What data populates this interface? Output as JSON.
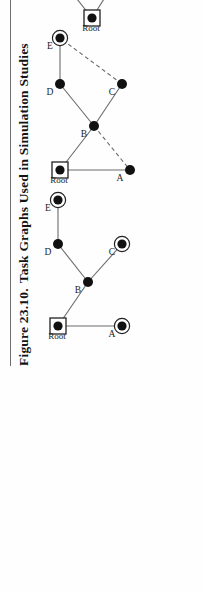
{
  "figure": {
    "caption_number": "Figure 23.10.",
    "caption_text": "Task Graphs Used in Simulation Studies"
  },
  "legend": {
    "items": [
      {
        "label": "Specialized Node",
        "symbol": "filled-dot"
      },
      {
        "label": "BFS tree edge",
        "symbol": "solid-line"
      },
      {
        "label": "nonBFS edge",
        "symbol": "dashed-line"
      },
      {
        "label": "Data Source",
        "symbol": "square-with-dot"
      },
      {
        "label": "Data Sink",
        "symbol": "double-circle"
      }
    ]
  },
  "colors": {
    "node_fill": "#111111",
    "edge": "#6a6a6a",
    "box_border": "#7c7c7c",
    "text": "#1d1d1d",
    "page_background": "#fefefe"
  },
  "graphs": [
    {
      "name": "graph-a",
      "nodes": [
        {
          "id": "Root",
          "label": "Root",
          "type": "source",
          "x": 22,
          "y": 28
        },
        {
          "id": "A",
          "label": "A",
          "type": "sink",
          "x": 22,
          "y": 92
        },
        {
          "id": "B",
          "label": "B",
          "type": "plain",
          "x": 66,
          "y": 58
        },
        {
          "id": "C",
          "label": "C",
          "type": "sink",
          "x": 104,
          "y": 92
        },
        {
          "id": "D",
          "label": "D",
          "type": "plain",
          "x": 104,
          "y": 28
        },
        {
          "id": "E",
          "label": "E",
          "type": "sink",
          "x": 148,
          "y": 28
        }
      ],
      "edges": [
        {
          "from": "Root",
          "to": "A",
          "style": "bfs"
        },
        {
          "from": "Root",
          "to": "B",
          "style": "bfs"
        },
        {
          "from": "B",
          "to": "C",
          "style": "bfs"
        },
        {
          "from": "B",
          "to": "D",
          "style": "bfs"
        },
        {
          "from": "D",
          "to": "E",
          "style": "bfs"
        }
      ]
    },
    {
      "name": "graph-b",
      "nodes": [
        {
          "id": "Root",
          "label": "Root",
          "type": "source",
          "x": 18,
          "y": 30
        },
        {
          "id": "A",
          "label": "A",
          "type": "plain",
          "x": 18,
          "y": 100
        },
        {
          "id": "B",
          "label": "B",
          "type": "plain",
          "x": 62,
          "y": 64
        },
        {
          "id": "C",
          "label": "C",
          "type": "plain",
          "x": 104,
          "y": 92
        },
        {
          "id": "D",
          "label": "D",
          "type": "plain",
          "x": 104,
          "y": 30
        },
        {
          "id": "E",
          "label": "E",
          "type": "sink",
          "x": 150,
          "y": 30
        }
      ],
      "edges": [
        {
          "from": "Root",
          "to": "A",
          "style": "bfs"
        },
        {
          "from": "Root",
          "to": "B",
          "style": "bfs"
        },
        {
          "from": "B",
          "to": "A",
          "style": "nonbfs"
        },
        {
          "from": "B",
          "to": "C",
          "style": "bfs"
        },
        {
          "from": "B",
          "to": "D",
          "style": "bfs"
        },
        {
          "from": "D",
          "to": "E",
          "style": "bfs"
        },
        {
          "from": "C",
          "to": "E",
          "style": "nonbfs"
        }
      ]
    },
    {
      "name": "graph-c",
      "nodes": [
        {
          "id": "Root",
          "label": "Root",
          "type": "source",
          "x": 14,
          "y": 62
        },
        {
          "id": "A",
          "label": "A",
          "type": "plain",
          "x": 52,
          "y": 86
        },
        {
          "id": "B",
          "label": "B",
          "type": "plain",
          "x": 52,
          "y": 32
        },
        {
          "id": "C",
          "label": "C",
          "type": "plain",
          "x": 104,
          "y": 108
        },
        {
          "id": "D",
          "label": "D",
          "type": "sink",
          "x": 104,
          "y": 64
        },
        {
          "id": "E",
          "label": "E",
          "type": "plain",
          "x": 104,
          "y": 10
        },
        {
          "id": "F",
          "label": "F",
          "type": "plain",
          "x": 150,
          "y": 132
        },
        {
          "id": "G",
          "label": "G",
          "type": "sink",
          "x": 150,
          "y": 84
        },
        {
          "id": "H",
          "label": "H",
          "type": "sink",
          "x": 190,
          "y": 132
        }
      ],
      "edges": [
        {
          "from": "Root",
          "to": "A",
          "style": "bfs"
        },
        {
          "from": "Root",
          "to": "B",
          "style": "bfs"
        },
        {
          "from": "B",
          "to": "E",
          "style": "bfs"
        },
        {
          "from": "A",
          "to": "C",
          "style": "bfs"
        },
        {
          "from": "A",
          "to": "D",
          "style": "nonbfs"
        },
        {
          "from": "B",
          "to": "D",
          "style": "nonbfs"
        },
        {
          "from": "E",
          "to": "D",
          "style": "nonbfs"
        },
        {
          "from": "C",
          "to": "D",
          "style": "nonbfs"
        },
        {
          "from": "D",
          "to": "G",
          "style": "nonbfs"
        },
        {
          "from": "C",
          "to": "G",
          "style": "bfs"
        },
        {
          "from": "C",
          "to": "F",
          "style": "bfs"
        },
        {
          "from": "F",
          "to": "H",
          "style": "bfs"
        }
      ]
    }
  ]
}
